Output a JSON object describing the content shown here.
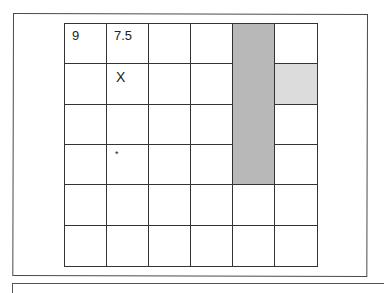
{
  "board": {
    "rows": 6,
    "cols": 6,
    "colors": {
      "dark_shade": "#b8b8b8",
      "light_shade": "#dcdcdc",
      "line": "#333333"
    },
    "cells": [
      [
        {
          "text": "9"
        },
        {
          "text": "7.5"
        },
        {},
        {},
        {
          "shade": "dark"
        },
        {}
      ],
      [
        {},
        {
          "mark": "X"
        },
        {},
        {},
        {
          "shade": "dark"
        },
        {
          "shade": "light"
        }
      ],
      [
        {},
        {},
        {},
        {},
        {
          "shade": "dark"
        },
        {}
      ],
      [
        {},
        {
          "mark": "*"
        },
        {},
        {},
        {
          "shade": "dark"
        },
        {}
      ],
      [
        {},
        {},
        {},
        {},
        {},
        {}
      ],
      [
        {},
        {},
        {},
        {},
        {},
        {}
      ]
    ]
  }
}
